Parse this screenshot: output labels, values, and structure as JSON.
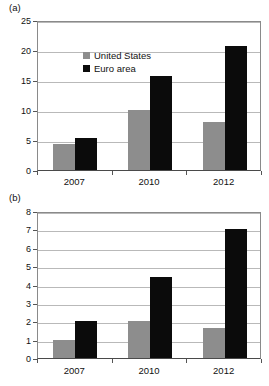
{
  "figure": {
    "panel_a_letter": "(a)",
    "panel_b_letter": "(b)"
  },
  "legend": {
    "position": "top-left-inside-panel-a",
    "entries": [
      {
        "label": "United States",
        "color": "#8d8d8d",
        "swatch": "square-swatch-gray"
      },
      {
        "label": "Euro area",
        "color": "#0b0b0b",
        "swatch": "square-swatch-black"
      }
    ]
  },
  "chart_data": [
    {
      "type": "bar",
      "panel": "(a)",
      "title": "",
      "xlabel": "",
      "ylabel": "",
      "categories": [
        "2007",
        "2010",
        "2012"
      ],
      "series": [
        {
          "name": "United States",
          "color": "#8d8d8d",
          "values": [
            4.4,
            10.0,
            8.0
          ]
        },
        {
          "name": "Euro area",
          "color": "#0b0b0b",
          "values": [
            5.3,
            15.7,
            20.7
          ]
        }
      ],
      "ylim": [
        0,
        25
      ],
      "yticks": [
        0,
        5,
        10,
        15,
        20,
        25
      ],
      "ytick_labels": [
        "0",
        "5",
        "10",
        "15",
        "20",
        "25"
      ],
      "grid": true,
      "legend_position": "upper left"
    },
    {
      "type": "bar",
      "panel": "(b)",
      "title": "",
      "xlabel": "",
      "ylabel": "",
      "categories": [
        "2007",
        "2010",
        "2012"
      ],
      "series": [
        {
          "name": "United States",
          "color": "#8d8d8d",
          "values": [
            1.0,
            2.0,
            1.65
          ]
        },
        {
          "name": "Euro area",
          "color": "#0b0b0b",
          "values": [
            2.0,
            4.4,
            7.0
          ]
        }
      ],
      "ylim": [
        0,
        8
      ],
      "yticks": [
        0,
        1,
        2,
        3,
        4,
        5,
        6,
        7,
        8
      ],
      "ytick_labels": [
        "0",
        "1",
        "2",
        "3",
        "4",
        "5",
        "6",
        "7",
        "8"
      ],
      "grid": true,
      "legend_position": "none"
    }
  ]
}
